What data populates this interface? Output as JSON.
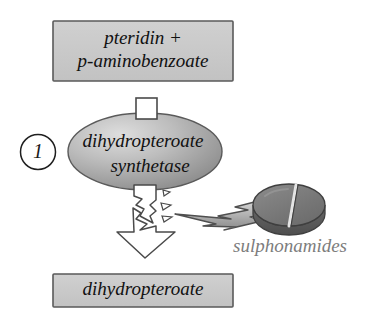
{
  "diagram": {
    "step_number": "1",
    "substrate_box": {
      "line1": "pteridin +",
      "line2": "p-aminobenzoate"
    },
    "enzyme_ellipse": {
      "line1": "dihydropteroate",
      "line2": "synthetase"
    },
    "product_box": {
      "line1": "dihydropteroate"
    },
    "drug": {
      "label": "sulphonamides"
    },
    "icons": {
      "substrate_connector": "white-square-icon",
      "broken_arrow": "broken-down-arrow-icon",
      "lightning": "lightning-bolt-icon",
      "tablet": "pill-tablet-icon",
      "step_badge": "circled-number-icon"
    },
    "colors": {
      "box_fill": "#c9c9c9",
      "box_stroke": "#555555",
      "ellipse_light": "#d8d8d8",
      "ellipse_dark": "#8e8e8e",
      "ellipse_stroke": "#5a5a5a",
      "arrow_fill": "#ffffff",
      "arrow_stroke": "#4a4a4a",
      "bolt_light": "#d2d2d2",
      "bolt_dark": "#8f8f8f",
      "bolt_stroke": "#4f4f4f",
      "tablet_top": "#7a7a7a",
      "tablet_side": "#5e5e5e",
      "tablet_stroke": "#3f3f3f",
      "drug_text": "#7d7d7d",
      "text": "#111111"
    }
  }
}
